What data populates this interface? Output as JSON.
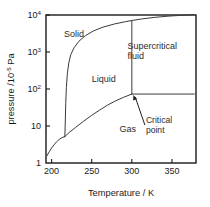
{
  "figure": {
    "name": "phase-diagram",
    "background": "#ffffff",
    "line_color": "#3a3a3a",
    "axis_color": "#1a1a1a",
    "text_color": "#2b2b2b"
  },
  "chart_data": {
    "type": "line",
    "title": "",
    "subtitle": "",
    "xlabel_parts": {
      "name": "Temperature",
      "separator": "/",
      "unit": "K"
    },
    "xlabel": "Temperature / K",
    "ylabel_parts": {
      "name": "pressure",
      "separator": "/",
      "unit_base": "10",
      "unit_exp": "-5",
      "unit_tail": " Pa"
    },
    "ylabel": "pressure /10^-5 Pa",
    "xlim": [
      193,
      380
    ],
    "ylim": [
      1,
      10000
    ],
    "yscale": "log",
    "xscale": "linear",
    "grid": false,
    "legend": null,
    "xticks": [
      {
        "value": 200,
        "label": "200"
      },
      {
        "value": 250,
        "label": "250"
      },
      {
        "value": 300,
        "label": "300"
      },
      {
        "value": 350,
        "label": "350"
      }
    ],
    "yticks": [
      {
        "value": 1,
        "label": "1",
        "mantissa": "1",
        "exponent": ""
      },
      {
        "value": 10,
        "label": "10",
        "mantissa": "10",
        "exponent": ""
      },
      {
        "value": 100,
        "label": "10^2",
        "mantissa": "10",
        "exponent": "2"
      },
      {
        "value": 1000,
        "label": "10^3",
        "mantissa": "10",
        "exponent": "3"
      },
      {
        "value": 10000,
        "label": "10^4",
        "mantissa": "10",
        "exponent": "4"
      }
    ],
    "annotations": [
      {
        "id": "solid",
        "text": "Solid",
        "x": 228,
        "y": 2600
      },
      {
        "id": "liquid",
        "text": "Liquid",
        "x": 265,
        "y": 150
      },
      {
        "id": "gas",
        "text": "Gas",
        "x": 295,
        "y": 7
      },
      {
        "id": "supercritical-fluid",
        "text": "Supercritical fluid",
        "lines": [
          "Supercritical",
          "fluid"
        ],
        "x": 322,
        "y": 1200
      },
      {
        "id": "critical-point",
        "text": "Critical point",
        "lines": [
          "Critical",
          "point"
        ],
        "x": 330,
        "y": 12,
        "arrow_to": {
          "x": 300,
          "y": 73
        }
      }
    ],
    "key_points": {
      "triple_point": {
        "x": 216.5,
        "y": 5.2,
        "label": "triple point"
      },
      "critical_point": {
        "x": 300,
        "y": 73,
        "label": "Critical point"
      }
    },
    "series": [
      {
        "name": "sublimation-curve",
        "description": "solid-gas boundary",
        "points": [
          [
            194,
            1.55
          ],
          [
            197,
            2.0
          ],
          [
            200,
            2.55
          ],
          [
            203,
            3.1
          ],
          [
            206,
            3.7
          ],
          [
            209,
            4.25
          ],
          [
            212,
            4.75
          ],
          [
            216.5,
            5.2
          ]
        ]
      },
      {
        "name": "melting-curve",
        "description": "solid-liquid boundary, near-vertical then curving right",
        "points": [
          [
            216.5,
            5.2
          ],
          [
            217.0,
            12
          ],
          [
            217.6,
            40
          ],
          [
            218.4,
            110
          ],
          [
            219.6,
            260
          ],
          [
            221.5,
            520
          ],
          [
            224,
            860
          ],
          [
            228,
            1300
          ],
          [
            234,
            1950
          ],
          [
            242,
            2750
          ],
          [
            252,
            3700
          ],
          [
            264,
            4700
          ],
          [
            278,
            5700
          ],
          [
            292,
            6600
          ],
          [
            300,
            7100
          ],
          [
            312,
            7800
          ],
          [
            328,
            8600
          ],
          [
            345,
            9300
          ],
          [
            362,
            9800
          ],
          [
            378,
            10200
          ]
        ]
      },
      {
        "name": "vaporization-curve",
        "description": "liquid-gas boundary from triple point to critical point",
        "points": [
          [
            216.5,
            5.2
          ],
          [
            222,
            6.7
          ],
          [
            230,
            9.2
          ],
          [
            240,
            13.5
          ],
          [
            250,
            19.5
          ],
          [
            260,
            27
          ],
          [
            270,
            37
          ],
          [
            280,
            48
          ],
          [
            290,
            60
          ],
          [
            300,
            73
          ]
        ]
      },
      {
        "name": "critical-isotherm",
        "description": "vertical line at critical temperature above critical point",
        "points": [
          [
            300,
            73
          ],
          [
            300,
            7100
          ]
        ]
      },
      {
        "name": "critical-isobar",
        "description": "horizontal line at critical pressure right of critical point",
        "points": [
          [
            300,
            73
          ],
          [
            378,
            73
          ]
        ]
      }
    ]
  }
}
